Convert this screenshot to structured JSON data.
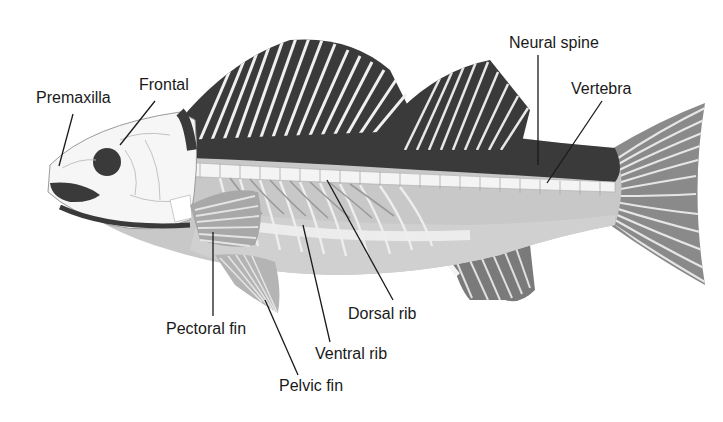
{
  "diagram": {
    "colors": {
      "background": "#ffffff",
      "dark_fin": "#3a3a3a",
      "mid_gray": "#8a8a8a",
      "light_gray": "#c4c4c4",
      "body_pale": "#d6d6d6",
      "bone": "#f4f4f4",
      "line": "#1a1a1a"
    },
    "labels": {
      "premaxilla": "Premaxilla",
      "frontal": "Frontal",
      "neural_spine": "Neural spine",
      "vertebra": "Vertebra",
      "dorsal_rib": "Dorsal rib",
      "ventral_rib": "Ventral rib",
      "pectoral_fin": "Pectoral fin",
      "pelvic_fin": "Pelvic fin"
    }
  }
}
